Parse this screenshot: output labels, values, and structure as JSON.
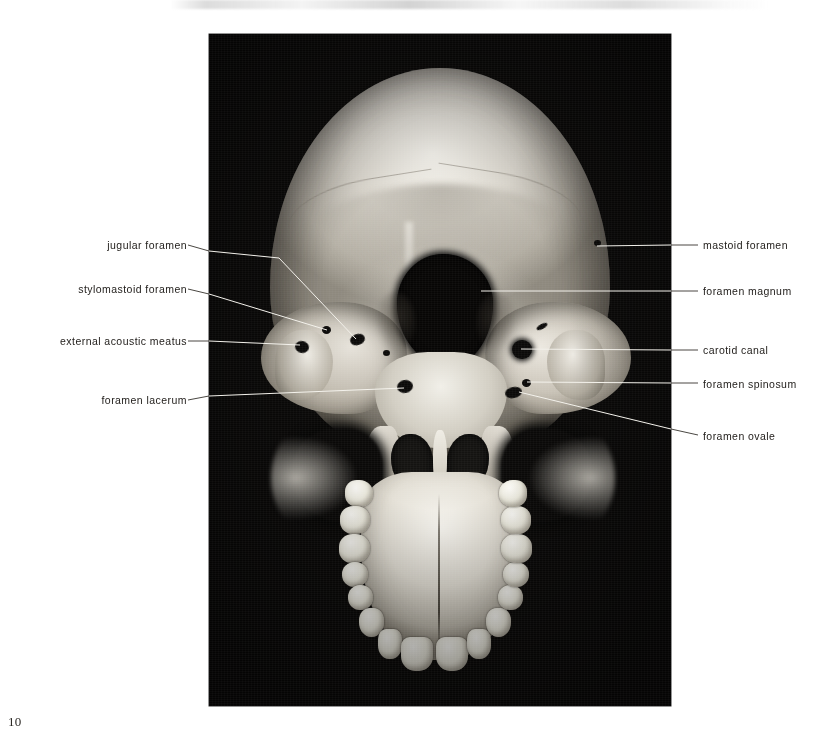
{
  "page": {
    "folio": "10",
    "plate_caption": ""
  },
  "figure": {
    "background_color": "#0a0908",
    "label_color": "#24211e",
    "leader_color_on_photo": "#f2f0ea",
    "leader_color_on_page": "#4a4742"
  },
  "labels_left": [
    {
      "id": "jugular-foramen",
      "text": "jugular foramen"
    },
    {
      "id": "stylomastoid-foramen",
      "text": "stylomastoid foramen"
    },
    {
      "id": "external-acoustic-meatus",
      "text": "external acoustic meatus"
    },
    {
      "id": "foramen-lacerum",
      "text": "foramen lacerum"
    }
  ],
  "labels_right": [
    {
      "id": "mastoid-foramen",
      "text": "mastoid foramen"
    },
    {
      "id": "foramen-magnum",
      "text": "foramen magnum"
    },
    {
      "id": "carotid-canal",
      "text": "carotid canal"
    },
    {
      "id": "foramen-spinosum",
      "text": "foramen spinosum"
    },
    {
      "id": "foramen-ovale",
      "text": "foramen ovale"
    }
  ]
}
